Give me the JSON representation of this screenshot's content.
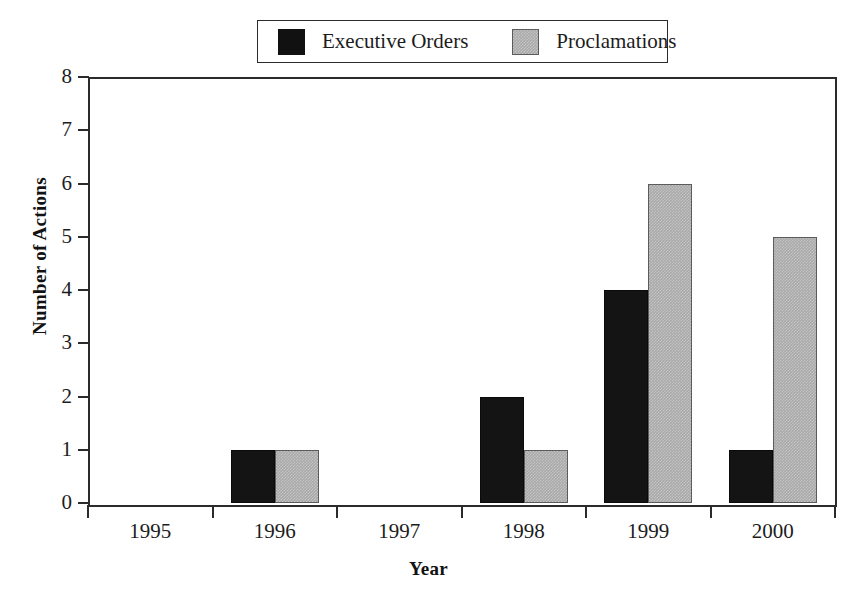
{
  "chart_data": {
    "type": "bar",
    "title": "",
    "xlabel": "Year",
    "ylabel": "Number of Actions",
    "categories": [
      "1995",
      "1996",
      "1997",
      "1998",
      "1999",
      "2000"
    ],
    "series": [
      {
        "name": "Executive Orders",
        "color": "#141414",
        "values": [
          0,
          1,
          0,
          2,
          4,
          1
        ]
      },
      {
        "name": "Proclamations",
        "color": "#a9a9a9",
        "values": [
          0,
          1,
          0,
          1,
          6,
          5
        ]
      }
    ],
    "ylim": [
      0,
      8
    ],
    "yticks": [
      "0",
      "1",
      "2",
      "3",
      "4",
      "5",
      "6",
      "7",
      "8"
    ],
    "grid": false,
    "legend_position": "top-center"
  },
  "legend": {
    "entries": [
      {
        "label": "Executive Orders",
        "swatch": "black-square-swatch"
      },
      {
        "label": "Proclamations",
        "swatch": "gray-square-swatch"
      }
    ]
  },
  "axes": {
    "y_title": "Number of Actions",
    "x_title": "Year"
  }
}
